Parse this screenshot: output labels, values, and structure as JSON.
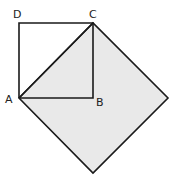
{
  "diagram": {
    "type": "geometry",
    "colors": {
      "stroke": "#1a1a1a",
      "fill": "#e9e9e9",
      "background": "#ffffff"
    },
    "points": {
      "A": {
        "label": "A",
        "x": 19,
        "y": 98
      },
      "B": {
        "label": "B",
        "x": 93,
        "y": 98
      },
      "C": {
        "label": "C",
        "x": 93,
        "y": 23
      },
      "D": {
        "label": "D",
        "x": 19,
        "y": 23
      },
      "E": {
        "x": 168,
        "y": 98
      },
      "F": {
        "x": 93,
        "y": 173
      }
    },
    "labels": {
      "A": "A",
      "B": "B",
      "C": "C",
      "D": "D"
    }
  }
}
